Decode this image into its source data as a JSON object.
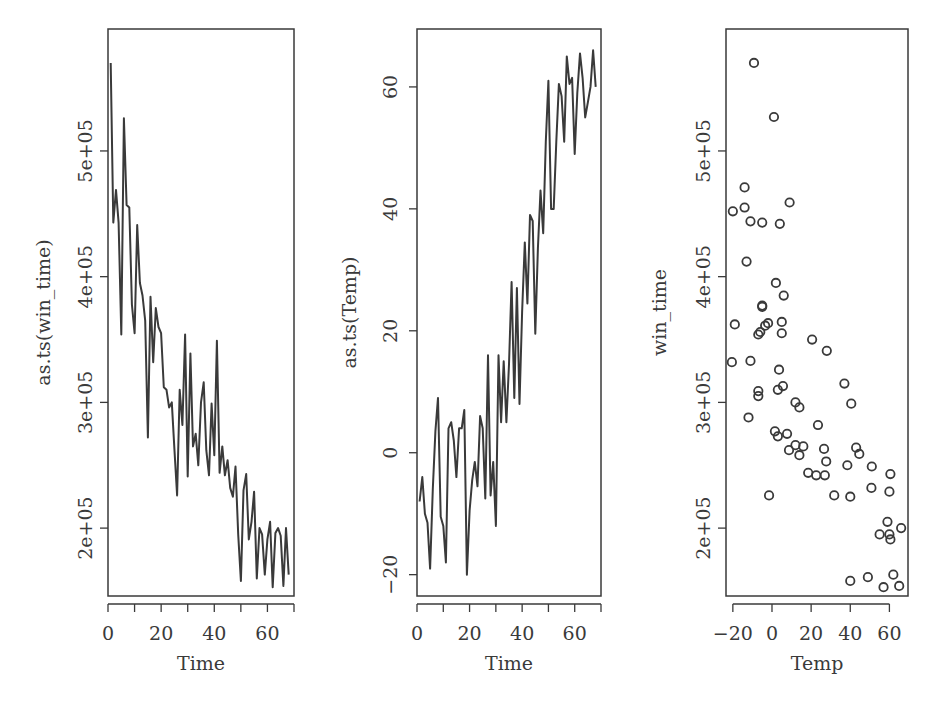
{
  "figure": {
    "background": "#ffffff",
    "ink_color": "#3a3a3a"
  },
  "chart_data": [
    {
      "type": "line",
      "title": "",
      "xlabel": "Time",
      "ylabel": "as.ts(win_time)",
      "xlim": [
        0,
        70
      ],
      "ylim": [
        146000,
        597000
      ],
      "xticks": [
        0,
        10,
        20,
        30,
        40,
        50,
        60,
        70
      ],
      "xtick_labels": [
        "0",
        "",
        "20",
        "",
        "40",
        "",
        "60",
        ""
      ],
      "yticks": [
        200000,
        300000,
        400000,
        500000
      ],
      "ytick_labels": [
        "2e+05",
        "3e+05",
        "4e+05",
        "5e+05"
      ],
      "grid": false,
      "x": [
        1,
        2,
        3,
        4,
        5,
        6,
        7,
        8,
        9,
        10,
        11,
        12,
        13,
        14,
        15,
        16,
        17,
        18,
        19,
        20,
        21,
        22,
        23,
        24,
        25,
        26,
        27,
        28,
        29,
        30,
        31,
        32,
        33,
        34,
        35,
        36,
        37,
        38,
        39,
        40,
        41,
        42,
        43,
        44,
        45,
        46,
        47,
        48,
        49,
        50,
        51,
        52,
        53,
        54,
        55,
        56,
        57,
        58,
        59,
        60,
        61,
        62,
        63,
        64,
        65,
        66,
        67,
        68
      ],
      "values": [
        570000,
        443000,
        469000,
        443000,
        354000,
        526000,
        457000,
        455000,
        378000,
        355000,
        441000,
        395000,
        385000,
        365000,
        272000,
        384000,
        332000,
        375000,
        360000,
        355000,
        312000,
        310000,
        296000,
        300000,
        263000,
        226000,
        310000,
        282000,
        354000,
        241000,
        339000,
        265000,
        275000,
        250000,
        300000,
        316000,
        262000,
        242000,
        299000,
        258000,
        349000,
        244000,
        265000,
        242000,
        254000,
        232000,
        225000,
        249000,
        195000,
        158000,
        230000,
        243000,
        191000,
        205000,
        229000,
        160000,
        200000,
        195000,
        163000,
        191000,
        205000,
        153000,
        196000,
        200000,
        194000,
        154000,
        200000,
        163000
      ]
    },
    {
      "type": "line",
      "title": "",
      "xlabel": "Time",
      "ylabel": "as.ts(Temp)",
      "xlim": [
        0,
        70
      ],
      "ylim": [
        -23.5,
        69.5
      ],
      "xticks": [
        0,
        10,
        20,
        30,
        40,
        50,
        60,
        70
      ],
      "xtick_labels": [
        "0",
        "",
        "20",
        "",
        "40",
        "",
        "60",
        ""
      ],
      "yticks": [
        -20,
        0,
        20,
        40,
        60
      ],
      "ytick_labels": [
        "−20",
        "0",
        "20",
        "40",
        "60"
      ],
      "grid": false,
      "x": [
        1,
        2,
        3,
        4,
        5,
        6,
        7,
        8,
        9,
        10,
        11,
        12,
        13,
        14,
        15,
        16,
        17,
        18,
        19,
        20,
        21,
        22,
        23,
        24,
        25,
        26,
        27,
        28,
        29,
        30,
        31,
        32,
        33,
        34,
        35,
        36,
        37,
        38,
        39,
        40,
        41,
        42,
        43,
        44,
        45,
        46,
        47,
        48,
        49,
        50,
        51,
        52,
        53,
        54,
        55,
        56,
        57,
        58,
        59,
        60,
        61,
        62,
        63,
        64,
        65,
        66,
        67,
        68
      ],
      "values": [
        -8,
        -4,
        -10,
        -11.5,
        -19,
        -6,
        3.5,
        9,
        -10.5,
        -12,
        -18,
        4,
        5,
        2,
        -4,
        4,
        4,
        7,
        -20,
        -9.5,
        -4.5,
        -1.5,
        -5.5,
        6,
        4,
        -7.5,
        16,
        -7,
        -1.5,
        -12,
        16,
        5,
        15,
        5,
        14.5,
        28,
        9,
        27,
        8,
        23,
        34.5,
        24.5,
        39,
        38,
        19.5,
        33.5,
        43,
        36,
        51,
        61,
        40,
        40,
        51,
        60.5,
        58.5,
        51,
        65,
        60.5,
        61.5,
        49,
        59,
        65.5,
        61.5,
        55,
        57.5,
        60,
        66,
        60
      ]
    },
    {
      "type": "scatter",
      "title": "",
      "xlabel": "Temp",
      "ylabel": "win_time",
      "xlim": [
        -23.5,
        69.5
      ],
      "ylim": [
        146000,
        597000
      ],
      "xticks": [
        -20,
        0,
        20,
        40,
        60
      ],
      "xtick_labels": [
        "−20",
        "0",
        "20",
        "40",
        "60"
      ],
      "yticks": [
        200000,
        300000,
        400000,
        500000
      ],
      "ytick_labels": [
        "2e+05",
        "3e+05",
        "4e+05",
        "5e+05"
      ],
      "grid": false,
      "marker": "open-circle",
      "points": [
        [
          -9.2,
          570000
        ],
        [
          1,
          527000
        ],
        [
          -14,
          471000
        ],
        [
          9,
          459000
        ],
        [
          -20,
          452000
        ],
        [
          -14,
          455000
        ],
        [
          -11,
          444000
        ],
        [
          -5,
          443000
        ],
        [
          4,
          442000
        ],
        [
          -13,
          412000
        ],
        [
          2,
          395000
        ],
        [
          6,
          385000
        ],
        [
          -5,
          377000
        ],
        [
          -5,
          376000
        ],
        [
          -19,
          362000
        ],
        [
          -2,
          363000
        ],
        [
          5,
          364000
        ],
        [
          -3.5,
          361000
        ],
        [
          -6,
          356000
        ],
        [
          -7,
          354000
        ],
        [
          5,
          355000
        ],
        [
          20.5,
          350000
        ],
        [
          28,
          341000
        ],
        [
          -20.5,
          332000
        ],
        [
          -11,
          333000
        ],
        [
          3.6,
          326000
        ],
        [
          -7,
          309000
        ],
        [
          -7,
          305000
        ],
        [
          5.6,
          313000
        ],
        [
          3,
          310000
        ],
        [
          37,
          315000
        ],
        [
          12,
          300000
        ],
        [
          14,
          296000
        ],
        [
          40.5,
          299000
        ],
        [
          -12,
          288000
        ],
        [
          23.5,
          282000
        ],
        [
          1.5,
          277000
        ],
        [
          3,
          273000
        ],
        [
          7.7,
          275000
        ],
        [
          8.7,
          262000
        ],
        [
          12,
          266000
        ],
        [
          14,
          258000
        ],
        [
          16,
          265000
        ],
        [
          26.6,
          263000
        ],
        [
          43,
          264000
        ],
        [
          44.6,
          259000
        ],
        [
          27.7,
          253000
        ],
        [
          38.5,
          250000
        ],
        [
          18.5,
          244000
        ],
        [
          22.6,
          242000
        ],
        [
          27,
          242000
        ],
        [
          51,
          249000
        ],
        [
          60.5,
          243000
        ],
        [
          -1.5,
          226000
        ],
        [
          31.8,
          226000
        ],
        [
          40,
          225000
        ],
        [
          50.8,
          232000
        ],
        [
          60,
          229000
        ],
        [
          59,
          205000
        ],
        [
          55,
          195000
        ],
        [
          60,
          195000
        ],
        [
          60.5,
          191000
        ],
        [
          66,
          200000
        ],
        [
          40,
          158000
        ],
        [
          49,
          161000
        ],
        [
          62,
          163000
        ],
        [
          57,
          153000
        ],
        [
          65,
          154000
        ]
      ]
    }
  ]
}
